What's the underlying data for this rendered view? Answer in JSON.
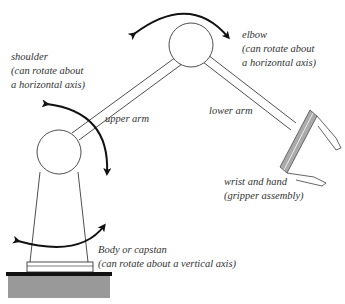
{
  "diagram": {
    "type": "robot-arm-anatomy",
    "labels": {
      "elbow": {
        "title": "elbow",
        "note": "(can rotate about",
        "note2": "a horizontal axis)"
      },
      "shoulder": {
        "title": "shoulder",
        "note": "(can rotate about",
        "note2": "a horizontal axis)"
      },
      "upper_arm": "upper arm",
      "lower_arm": "lower arm",
      "wrist": {
        "title": "wrist and hand",
        "note": "(gripper assembly)"
      },
      "body": {
        "title": "Body or capstan",
        "note": "(can rotate about a vertical axis)"
      }
    },
    "colors": {
      "stroke": "#222222",
      "gripper_fill": "#aaaaaa",
      "base_fill": "#999999",
      "text": "#333333"
    }
  }
}
